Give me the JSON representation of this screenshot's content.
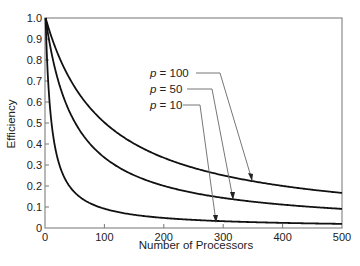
{
  "chart_data": {
    "type": "line",
    "title": "",
    "xlabel": "Number of Processors",
    "ylabel": "Efficiency",
    "xlim": [
      0,
      500
    ],
    "ylim": [
      0,
      1.0
    ],
    "grid": false,
    "x_ticks": [
      0,
      100,
      200,
      300,
      400,
      500
    ],
    "x_tick_labels": [
      "0",
      "100",
      "200",
      "300",
      "400",
      "500"
    ],
    "y_ticks": [
      0,
      0.1,
      0.2,
      0.3,
      0.4,
      0.5,
      0.6,
      0.7,
      0.8,
      0.9,
      1.0
    ],
    "y_tick_labels": [
      "0",
      "0.1",
      "0.2",
      "0.3",
      "0.4",
      "0.5",
      "0.6",
      "0.7",
      "0.8",
      "0.9",
      "1.0"
    ],
    "formula": "E = p / (p + N - 1)",
    "x": [
      1,
      10,
      25,
      50,
      100,
      150,
      200,
      250,
      300,
      350,
      400,
      450,
      500
    ],
    "series": [
      {
        "name": "p = 100",
        "p": 100,
        "values": [
          1.0,
          0.917,
          0.806,
          0.671,
          0.503,
          0.402,
          0.334,
          0.286,
          0.251,
          0.223,
          0.201,
          0.182,
          0.167
        ]
      },
      {
        "name": "p = 50",
        "p": 50,
        "values": [
          1.0,
          0.847,
          0.676,
          0.505,
          0.336,
          0.252,
          0.201,
          0.167,
          0.143,
          0.125,
          0.111,
          0.1,
          0.091
        ]
      },
      {
        "name": "p = 10",
        "p": 10,
        "values": [
          1.0,
          0.526,
          0.294,
          0.169,
          0.092,
          0.063,
          0.048,
          0.039,
          0.032,
          0.028,
          0.024,
          0.022,
          0.02
        ]
      }
    ],
    "legend_position": "annotations with leader arrows, center of plot",
    "colors": {
      "line": "#111111",
      "axis": "#555555",
      "leader": "#666666"
    }
  },
  "labels": {
    "p_symbol": "p",
    "eq": " = ",
    "p100": "100",
    "p50": "50",
    "p10": "10"
  }
}
